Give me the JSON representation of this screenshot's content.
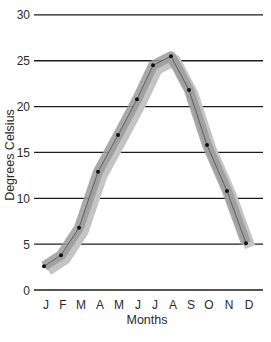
{
  "chart_data": {
    "type": "line",
    "title": "",
    "xlabel": "Months",
    "ylabel": "Degrees Celsius",
    "categories": [
      "J",
      "F",
      "M",
      "A",
      "M",
      "J",
      "J",
      "A",
      "S",
      "O",
      "N",
      "D"
    ],
    "series": [
      {
        "name": "Temperature",
        "values": [
          2.6,
          3.8,
          6.8,
          12.9,
          16.9,
          20.8,
          24.5,
          25.5,
          21.8,
          15.8,
          10.8,
          5.1
        ],
        "style": "points connected by thin line with wide grey band"
      }
    ],
    "yticks": [
      0,
      5,
      10,
      15,
      20,
      25,
      30
    ],
    "ylim": [
      0,
      30
    ],
    "grid": true,
    "legend": null
  },
  "colors": {
    "band": "#9a9a9a",
    "band_light": "#c4c4c4",
    "line": "#2a2a2a",
    "point": "#111111",
    "grid": "#1c1c1c"
  },
  "labels": {
    "ylabel": "Degrees Celsius",
    "xlabel": "Months"
  }
}
